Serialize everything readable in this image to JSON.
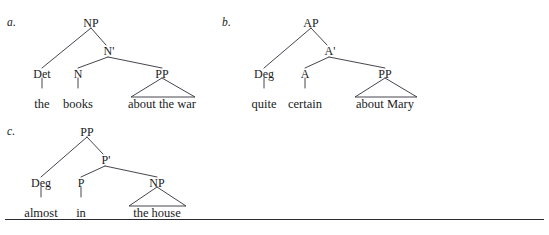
{
  "figure": {
    "caption_rule": true,
    "background": "#ffffff",
    "line_color": "#30303a"
  },
  "trees": [
    {
      "id": "tree-a",
      "label": "a.",
      "phrase": "the books about the war",
      "root": "NP",
      "bar_node": "N'",
      "nodes": {
        "root": "NP",
        "bar": "N'",
        "specifier": "Det",
        "head": "N",
        "complement": "PP"
      },
      "terminals": {
        "specifier": "the",
        "head": "books",
        "complement": "about the war"
      }
    },
    {
      "id": "tree-b",
      "label": "b.",
      "phrase": "quite certain about Mary",
      "root": "AP",
      "bar_node": "A'",
      "nodes": {
        "root": "AP",
        "bar": "A'",
        "specifier": "Deg",
        "head": "A",
        "complement": "PP"
      },
      "terminals": {
        "specifier": "quite",
        "head": "certain",
        "complement": "about Mary"
      }
    },
    {
      "id": "tree-c",
      "label": "c.",
      "phrase": "almost in the house",
      "root": "PP",
      "bar_node": "P'",
      "nodes": {
        "root": "PP",
        "bar": "P'",
        "specifier": "Deg",
        "head": "P",
        "complement": "NP"
      },
      "terminals": {
        "specifier": "almost",
        "head": "in",
        "complement": "the house"
      }
    }
  ]
}
